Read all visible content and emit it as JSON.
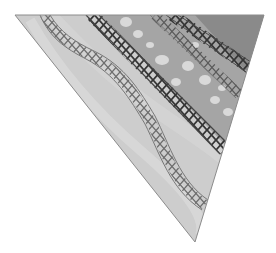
{
  "image": {
    "description": "Grayscale photograph of a triangular piece of fabric with decorative cross/herringbone stitching",
    "background_color": "#ffffff",
    "fabric_colors": {
      "light_band": "#cfcfcf",
      "medium_floral_band": "#a8a8a8",
      "dark_corner_band": "#8e8e8e",
      "stitch_dark": "#3a3a3a",
      "stitch_medium": "#6a6a6a",
      "floral_highlight": "#e6e6e6"
    },
    "stitch_rows": [
      {
        "name": "wavy-stitch",
        "tone": "medium"
      },
      {
        "name": "diagonal-stitch-middle",
        "tone": "dark"
      },
      {
        "name": "diagonal-stitch-upper",
        "tone": "light"
      },
      {
        "name": "diagonal-stitch-corner",
        "tone": "dark"
      }
    ]
  }
}
